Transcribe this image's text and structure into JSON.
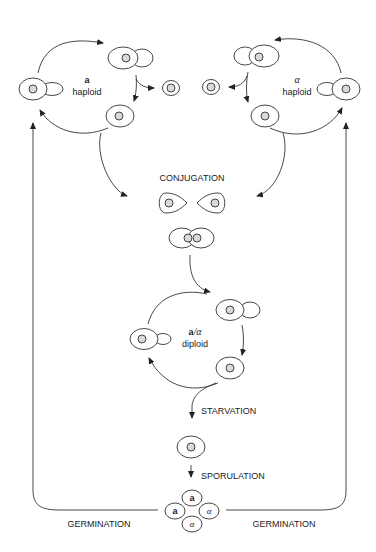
{
  "labels": {
    "a_haploid_mating": "a",
    "a_haploid": "haploid",
    "alpha_haploid_mating": "α",
    "alpha_haploid": "haploid",
    "conjugation": "CONJUGATION",
    "diploid_mating": "a/α",
    "diploid_mating_a": "a",
    "diploid_mating_rest": "/α",
    "diploid": "diploid",
    "starvation": "STARVATION",
    "sporulation": "SPORULATION",
    "germination_left": "GERMINATION",
    "germination_right": "GERMINATION"
  },
  "spores": [
    "a",
    "a",
    "α",
    "α"
  ],
  "colors": {
    "line": "#333333",
    "nucleus": "#d9d9d9",
    "background": "#ffffff"
  }
}
